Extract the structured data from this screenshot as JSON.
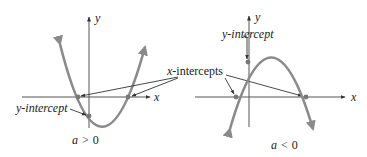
{
  "figure": {
    "left_panel": {
      "axis_x_label": "x",
      "axis_y_label": "y",
      "y_intercept_label": "y-intercept",
      "condition_var": "a",
      "condition_op": ">",
      "condition_val": "0",
      "opens": "up"
    },
    "right_panel": {
      "axis_x_label": "x",
      "axis_y_label": "y",
      "y_intercept_label": "y-intercept",
      "condition_var": "a",
      "condition_op": "<",
      "condition_val": "0",
      "opens": "down"
    },
    "shared_label": {
      "x_intercepts_var": "x",
      "x_intercepts_rest": "-intercepts"
    },
    "colors": {
      "curve": "#8a8a8a",
      "axes": "#555555",
      "text": "#1a1a1a"
    }
  }
}
